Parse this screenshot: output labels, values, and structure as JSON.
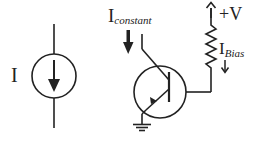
{
  "diagram": {
    "type": "circuit-schematic",
    "colors": {
      "stroke": "#222222",
      "background": "#ffffff"
    },
    "left_symbol": {
      "name": "current-source",
      "label": "I"
    },
    "right_circuit": {
      "name": "transistor-current-source",
      "input_label_main": "I",
      "input_label_sub": "constant",
      "supply_label": "+V",
      "bias_label_main": "I",
      "bias_label_sub": "Bias",
      "components": [
        "npn-transistor",
        "resistor",
        "ground",
        "supply-arrow",
        "current-arrow-constant",
        "current-arrow-bias"
      ]
    }
  }
}
